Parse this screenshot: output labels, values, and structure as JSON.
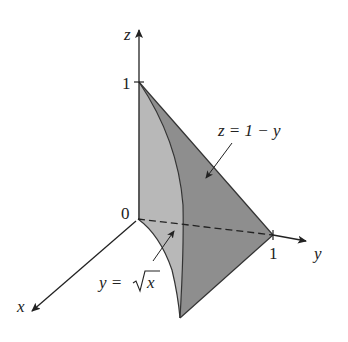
{
  "figure": {
    "type": "3d-solid-region",
    "axes": {
      "x": {
        "label": "x"
      },
      "y": {
        "label": "y",
        "tick": "1"
      },
      "z": {
        "label": "z",
        "tick": "1"
      },
      "origin": "0"
    },
    "annotations": {
      "plane": "z = 1 − y",
      "curve_lhs": "y =",
      "curve_rhs": "x"
    },
    "colors": {
      "light_face": "#b4b4b4",
      "dark_face": "#8a8a8a",
      "stroke": "#333333"
    }
  }
}
